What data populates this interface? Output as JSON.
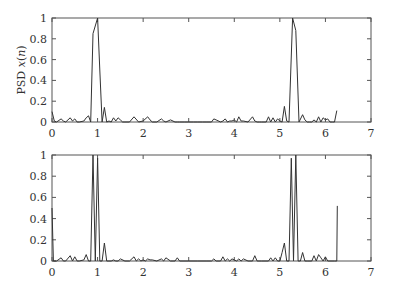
{
  "chart_data": [
    {
      "type": "line",
      "title": "",
      "xlabel": "",
      "ylabel": "PSD x(n)",
      "xlim": [
        0,
        7
      ],
      "ylim": [
        0,
        1
      ],
      "xticks": [
        "0",
        "1",
        "2",
        "3",
        "4",
        "5",
        "6",
        "7"
      ],
      "yticks": [
        "0",
        "0.2",
        "0.4",
        "0.6",
        "0.8",
        "1"
      ],
      "grid": false,
      "legend": null,
      "series": [
        {
          "name": "PSD",
          "x": [
            0,
            0.05,
            0.1,
            0.2,
            0.25,
            0.3,
            0.4,
            0.45,
            0.5,
            0.55,
            0.6,
            0.7,
            0.75,
            0.8,
            0.85,
            0.9,
            1.0,
            1.05,
            1.1,
            1.15,
            1.2,
            1.25,
            1.3,
            1.35,
            1.4,
            1.45,
            1.5,
            1.55,
            1.6,
            1.7,
            1.8,
            1.9,
            2.0,
            2.1,
            2.15,
            2.2,
            2.3,
            2.4,
            2.45,
            2.5,
            2.6,
            2.7,
            2.75,
            2.8,
            2.9,
            3.0,
            3.1,
            3.2,
            3.3,
            3.4,
            3.5,
            3.55,
            3.6,
            3.7,
            3.75,
            3.8,
            3.85,
            3.9,
            3.95,
            4.0,
            4.05,
            4.1,
            4.15,
            4.2,
            4.3,
            4.4,
            4.45,
            4.5,
            4.55,
            4.6,
            4.7,
            4.75,
            4.8,
            4.85,
            4.9,
            4.95,
            5.0,
            5.05,
            5.1,
            5.15,
            5.2,
            5.28,
            5.35,
            5.42,
            5.5,
            5.55,
            5.6,
            5.65,
            5.7,
            5.75,
            5.8,
            5.85,
            5.9,
            5.95,
            6.0,
            6.05,
            6.1,
            6.15,
            6.2,
            6.25
          ],
          "y": [
            0.1,
            0.01,
            0.0,
            0.03,
            0.01,
            0.0,
            0.04,
            0.01,
            0.03,
            0.0,
            0.0,
            0.01,
            0.04,
            0.06,
            0.0,
            0.85,
            1.0,
            0.5,
            0.0,
            0.14,
            0.0,
            0.01,
            0.0,
            0.04,
            0.01,
            0.04,
            0.02,
            0.0,
            0.0,
            0.0,
            0.05,
            0.0,
            0.01,
            0.05,
            0.02,
            0.0,
            0.0,
            0.03,
            0.01,
            0.0,
            0.02,
            0.0,
            0.0,
            0.0,
            0.0,
            0.0,
            0.0,
            0.0,
            0.0,
            0.0,
            0.0,
            0.03,
            0.02,
            0.0,
            0.01,
            0.03,
            0.0,
            0.01,
            0.01,
            0.02,
            0.0,
            0.05,
            0.01,
            0.01,
            0.0,
            0.05,
            0.01,
            0.0,
            0.0,
            0.0,
            0.0,
            0.05,
            0.0,
            0.04,
            0.0,
            0.03,
            0.01,
            0.0,
            0.15,
            0.01,
            0.0,
            1.0,
            0.88,
            0.0,
            0.07,
            0.02,
            0.0,
            0.0,
            0.0,
            0.02,
            0.0,
            0.05,
            0.0,
            0.04,
            0.02,
            0.03,
            0.0,
            0.0,
            0.0,
            0.11
          ]
        }
      ]
    },
    {
      "type": "line",
      "title": "",
      "xlabel": "",
      "ylabel": "",
      "xlim": [
        0,
        7
      ],
      "ylim": [
        0,
        1
      ],
      "xticks": [
        "0",
        "1",
        "2",
        "3",
        "4",
        "5",
        "6",
        "7"
      ],
      "yticks": [
        "0",
        "0.2",
        "0.4",
        "0.6",
        "0.8",
        "1"
      ],
      "grid": false,
      "legend": null,
      "series": [
        {
          "name": "PSD",
          "x": [
            0,
            0.03,
            0.1,
            0.2,
            0.25,
            0.3,
            0.4,
            0.45,
            0.5,
            0.55,
            0.6,
            0.7,
            0.75,
            0.8,
            0.85,
            0.9,
            0.95,
            1.0,
            1.05,
            1.1,
            1.15,
            1.2,
            1.25,
            1.3,
            1.35,
            1.4,
            1.45,
            1.5,
            1.6,
            1.7,
            1.8,
            1.85,
            1.9,
            1.95,
            2.0,
            2.05,
            2.1,
            2.15,
            2.2,
            2.3,
            2.4,
            2.45,
            2.5,
            2.6,
            2.7,
            2.75,
            2.8,
            3.0,
            3.2,
            3.4,
            3.5,
            3.55,
            3.6,
            3.7,
            3.75,
            3.8,
            3.85,
            3.9,
            3.95,
            4.0,
            4.05,
            4.1,
            4.15,
            4.2,
            4.3,
            4.4,
            4.45,
            4.5,
            4.6,
            4.75,
            4.8,
            4.85,
            4.9,
            4.95,
            5.0,
            5.05,
            5.1,
            5.15,
            5.2,
            5.25,
            5.3,
            5.35,
            5.4,
            5.45,
            5.5,
            5.55,
            5.6,
            5.7,
            5.75,
            5.8,
            5.85,
            5.9,
            5.95,
            6.0,
            6.05,
            6.1,
            6.2,
            6.25,
            6.26
          ],
          "y": [
            0.5,
            0.0,
            0.0,
            0.03,
            0.0,
            0.0,
            0.05,
            0.0,
            0.04,
            0.0,
            0.0,
            0.01,
            0.06,
            0.0,
            0.0,
            1.0,
            0.0,
            0.97,
            0.0,
            0.0,
            0.17,
            0.0,
            0.0,
            0.0,
            0.01,
            0.0,
            0.0,
            0.02,
            0.0,
            0.0,
            0.04,
            0.0,
            0.02,
            0.0,
            0.01,
            0.0,
            0.02,
            0.01,
            0.01,
            0.0,
            0.02,
            0.0,
            0.03,
            0.0,
            0.0,
            0.03,
            0.0,
            0.0,
            0.0,
            0.0,
            0.0,
            0.02,
            0.0,
            0.0,
            0.04,
            0.0,
            0.02,
            0.0,
            0.02,
            0.01,
            0.0,
            0.02,
            0.0,
            0.02,
            0.0,
            0.0,
            0.05,
            0.0,
            0.0,
            0.0,
            0.03,
            0.0,
            0.03,
            0.0,
            0.0,
            0.08,
            0.17,
            0.0,
            0.0,
            0.97,
            0.0,
            1.0,
            0.0,
            0.0,
            0.08,
            0.0,
            0.0,
            0.0,
            0.05,
            0.0,
            0.06,
            0.03,
            0.0,
            0.04,
            0.0,
            0.0,
            0.0,
            0.0,
            0.52
          ]
        }
      ]
    }
  ],
  "figure": {
    "panels": [
      {
        "ylabel_text": "PSD x(n)"
      },
      {
        "ylabel_text": ""
      }
    ]
  }
}
